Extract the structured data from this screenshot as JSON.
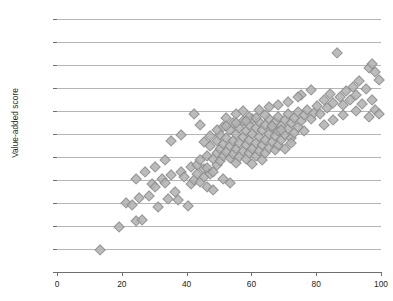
{
  "figure": {
    "title_remnant": "",
    "background": "#ffffff"
  },
  "axes": {
    "ylabel": "Value-added score",
    "xlabel": "",
    "y_ticks": [
      "880",
      "900",
      "920",
      "940",
      "960",
      "980",
      "1,000",
      "1,020",
      "1,040",
      "1,060",
      "1,080",
      "1,100"
    ],
    "x_ticks": [
      "0",
      "20",
      "40",
      "60",
      "80",
      "100"
    ]
  },
  "style": {
    "marker_fill": "#b3b3b3",
    "marker_edge": "#8a8a8a",
    "gridline_color": "#9c9c9c",
    "axis_color": "#6e6e6e",
    "text_color": "#231f20"
  },
  "chart_data": {
    "type": "scatter",
    "title": "",
    "xlabel": "",
    "ylabel": "Value-added score",
    "xlim": [
      0,
      100
    ],
    "ylim": [
      880,
      1100
    ],
    "x_ticks": [
      0,
      20,
      40,
      60,
      80,
      100
    ],
    "y_ticks": [
      880,
      900,
      920,
      940,
      960,
      980,
      1000,
      1020,
      1040,
      1060,
      1080,
      1100
    ],
    "grid": "horizontal",
    "legend": "none",
    "marker": "diamond",
    "series": [
      {
        "name": "schools",
        "points": [
          [
            13,
            900
          ],
          [
            19,
            920
          ],
          [
            21,
            941
          ],
          [
            23,
            939
          ],
          [
            24,
            925
          ],
          [
            25,
            945
          ],
          [
            26,
            926
          ],
          [
            28,
            947
          ],
          [
            29,
            957
          ],
          [
            30,
            955
          ],
          [
            31,
            937
          ],
          [
            32,
            962
          ],
          [
            33,
            958
          ],
          [
            34,
            944
          ],
          [
            35,
            965
          ],
          [
            36,
            950
          ],
          [
            37,
            943
          ],
          [
            38,
            968
          ],
          [
            39,
            963
          ],
          [
            40,
            938
          ],
          [
            41,
            972
          ],
          [
            41,
            957
          ],
          [
            42,
            961
          ],
          [
            43,
            974
          ],
          [
            43,
            966
          ],
          [
            44,
            959
          ],
          [
            44,
            978
          ],
          [
            45,
            970
          ],
          [
            45,
            963
          ],
          [
            46,
            982
          ],
          [
            46,
            971
          ],
          [
            47,
            966
          ],
          [
            47,
            990
          ],
          [
            48,
            979
          ],
          [
            48,
            968
          ],
          [
            49,
            995
          ],
          [
            49,
            984
          ],
          [
            49,
            974
          ],
          [
            50,
            1000
          ],
          [
            50,
            988
          ],
          [
            50,
            977
          ],
          [
            51,
            1007
          ],
          [
            51,
            992
          ],
          [
            51,
            982
          ],
          [
            52,
            1015
          ],
          [
            52,
            997
          ],
          [
            52,
            985
          ],
          [
            53,
            1004
          ],
          [
            53,
            990
          ],
          [
            53,
            980
          ],
          [
            54,
            1010
          ],
          [
            54,
            995
          ],
          [
            54,
            983
          ],
          [
            55,
            1018
          ],
          [
            55,
            1001
          ],
          [
            55,
            988
          ],
          [
            55,
            976
          ],
          [
            56,
            1006
          ],
          [
            56,
            993
          ],
          [
            56,
            981
          ],
          [
            57,
            1012
          ],
          [
            57,
            998
          ],
          [
            57,
            986
          ],
          [
            58,
            1003
          ],
          [
            58,
            991
          ],
          [
            58,
            979
          ],
          [
            59,
            1009
          ],
          [
            59,
            996
          ],
          [
            59,
            984
          ],
          [
            60,
            1014
          ],
          [
            60,
            1001
          ],
          [
            60,
            988
          ],
          [
            60,
            975
          ],
          [
            61,
            1006
          ],
          [
            61,
            993
          ],
          [
            61,
            982
          ],
          [
            62,
            1011
          ],
          [
            62,
            998
          ],
          [
            62,
            986
          ],
          [
            63,
            1004
          ],
          [
            63,
            991
          ],
          [
            63,
            978
          ],
          [
            64,
            1009
          ],
          [
            64,
            996
          ],
          [
            64,
            984
          ],
          [
            65,
            1014
          ],
          [
            65,
            1001
          ],
          [
            65,
            989
          ],
          [
            66,
            1006
          ],
          [
            66,
            994
          ],
          [
            67,
            1011
          ],
          [
            67,
            999
          ],
          [
            67,
            987
          ],
          [
            68,
            1016
          ],
          [
            68,
            1003
          ],
          [
            68,
            991
          ],
          [
            69,
            1008
          ],
          [
            69,
            996
          ],
          [
            70,
            1013
          ],
          [
            70,
            1000
          ],
          [
            70,
            988
          ],
          [
            71,
            1018
          ],
          [
            71,
            1005
          ],
          [
            72,
            1010
          ],
          [
            72,
            997
          ],
          [
            73,
            1015
          ],
          [
            73,
            1002
          ],
          [
            74,
            1020
          ],
          [
            74,
            1007
          ],
          [
            75,
            1035
          ],
          [
            75,
            1012
          ],
          [
            76,
            1017
          ],
          [
            77,
            1022
          ],
          [
            78,
            1014
          ],
          [
            79,
            1019
          ],
          [
            80,
            1025
          ],
          [
            81,
            1018
          ],
          [
            82,
            1030
          ],
          [
            83,
            1023
          ],
          [
            84,
            1036
          ],
          [
            85,
            1028
          ],
          [
            86,
            1071
          ],
          [
            87,
            1033
          ],
          [
            88,
            1026
          ],
          [
            89,
            1038
          ],
          [
            90,
            1030
          ],
          [
            91,
            1042
          ],
          [
            92,
            1035
          ],
          [
            93,
            1047
          ],
          [
            94,
            1027
          ],
          [
            95,
            1040
          ],
          [
            96,
            1058
          ],
          [
            96,
            1016
          ],
          [
            97,
            1062
          ],
          [
            97,
            1030
          ],
          [
            98,
            1055
          ],
          [
            98,
            1022
          ],
          [
            99,
            1048
          ],
          [
            99,
            1018
          ],
          [
            35,
            995
          ],
          [
            38,
            1000
          ],
          [
            42,
            1018
          ],
          [
            44,
            1009
          ],
          [
            46,
            955
          ],
          [
            48,
            952
          ],
          [
            51,
            962
          ],
          [
            53,
            958
          ],
          [
            57,
            1021
          ],
          [
            59,
            1016
          ],
          [
            62,
            1022
          ],
          [
            65,
            1024
          ],
          [
            68,
            1026
          ],
          [
            71,
            1029
          ],
          [
            74,
            1033
          ],
          [
            78,
            1039
          ],
          [
            33,
            978
          ],
          [
            30,
            972
          ],
          [
            27,
            968
          ],
          [
            24,
            962
          ],
          [
            55,
            1010
          ],
          [
            58,
            1012
          ],
          [
            61,
            1015
          ],
          [
            64,
            1017
          ],
          [
            49,
            1004
          ],
          [
            52,
            1008
          ],
          [
            47,
            999
          ],
          [
            45,
            994
          ],
          [
            66,
            1008
          ],
          [
            69,
            1004
          ],
          [
            72,
            993
          ],
          [
            76,
            1003
          ],
          [
            82,
            1009
          ],
          [
            85,
            1013
          ],
          [
            88,
            1017
          ],
          [
            92,
            1021
          ]
        ]
      }
    ]
  }
}
